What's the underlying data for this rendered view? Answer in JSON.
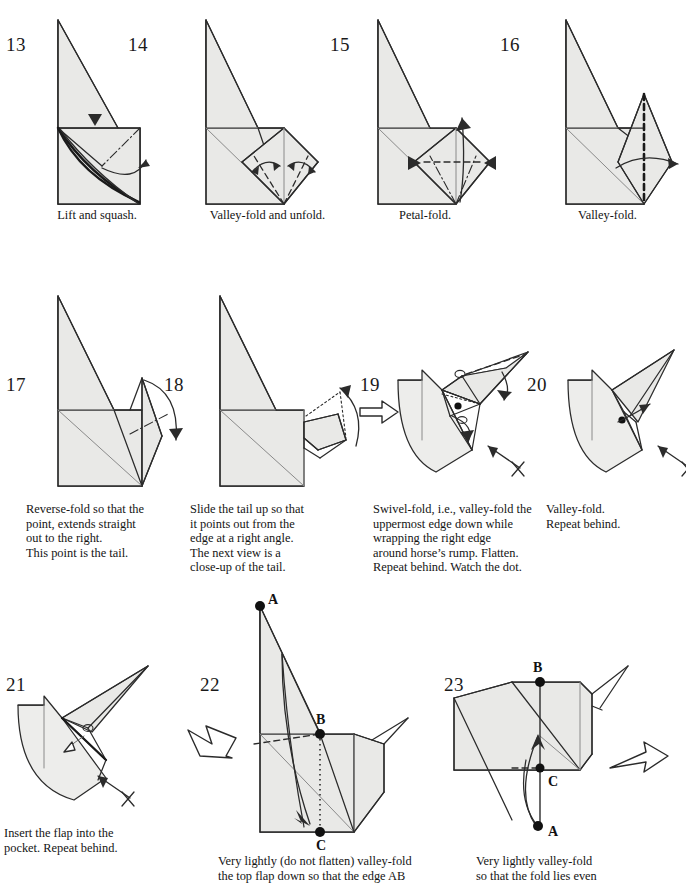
{
  "document": {
    "kind": "origami-instruction-sheet",
    "subject": "horse",
    "page_background": "#ffffff",
    "paper_fill": "#e9e9e7",
    "ink_color": "#2b2b2b"
  },
  "rows": [
    {
      "id": "row-1",
      "steps": [
        {
          "number": "13",
          "caption": "Lift and squash.",
          "symbols": [
            "push-arrowhead",
            "curved-turn-arrow",
            "mountain-crease",
            "valley-crease"
          ]
        },
        {
          "number": "14",
          "caption": "Valley-fold and unfold.",
          "symbols": [
            "double-headed-arrow-left",
            "double-headed-arrow-right",
            "valley-crease"
          ]
        },
        {
          "number": "15",
          "caption": "Petal-fold.",
          "symbols": [
            "push-arrowhead-left",
            "push-arrowhead-right",
            "up-arrow",
            "valley-crease",
            "mountain-crease"
          ]
        },
        {
          "number": "16",
          "caption": "Valley-fold.",
          "symbols": [
            "curved-fold-arrow-right",
            "valley-crease-bold-vertical"
          ]
        }
      ]
    },
    {
      "id": "row-2",
      "steps": [
        {
          "number": "17",
          "caption": "Reverse-fold so that the\npoint, extends straight\nout to the right.\nThis point is the tail.",
          "symbols": [
            "curved-fold-arrow-down",
            "mountain-crease"
          ]
        },
        {
          "number": "18",
          "caption": "Slide the tail up so that\nit points out from the\nedge at a right angle.\nThe next view is a\nclose-up of the tail.",
          "symbols": [
            "curved-slide-arrow-up",
            "hidden-edge-dotted"
          ]
        },
        {
          "number": "19",
          "caption": "Swivel-fold, i.e., valley-fold the\nuppermost edge down while\nwrapping the right edge\naround horse’s rump.  Flatten.\nRepeat behind.  Watch the dot.",
          "symbols": [
            "view-change-arrow-right",
            "repeat-behind-arrow-with-x",
            "valley-crease",
            "tracking-dot",
            "fold-arrow-down",
            "fold-arrow-right"
          ]
        },
        {
          "number": "20",
          "caption": "Valley-fold.\nRepeat behind.",
          "symbols": [
            "repeat-behind-arrow-with-x",
            "tracking-dot",
            "fold-arrow-up-right"
          ]
        }
      ]
    },
    {
      "id": "row-3",
      "steps": [
        {
          "number": "21",
          "caption": "Insert the flap into the\npocket.  Repeat behind.",
          "symbols": [
            "insert-arrow-hollow",
            "repeat-behind-arrow-with-x",
            "valley-crease-bold"
          ]
        },
        {
          "number": "22",
          "caption": "Very lightly (do not flatten) valley-fold\nthe top flap down so that the edge AB",
          "caption_bold_fragment": "AB",
          "points": [
            "A",
            "B",
            "C"
          ],
          "symbols": [
            "big-hollow-transition-arrow",
            "valley-crease",
            "dotted-guide-line",
            "fold-arrow-down"
          ]
        },
        {
          "number": "23",
          "caption": "Very lightly valley-fold\nso that the fold lies even",
          "points": [
            "A",
            "B",
            "C"
          ],
          "symbols": [
            "big-hollow-transition-arrow",
            "fold-arrow-up",
            "valley-crease",
            "dotted-guide-line"
          ]
        }
      ]
    }
  ]
}
